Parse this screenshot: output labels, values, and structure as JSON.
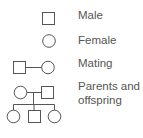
{
  "legend": {
    "items": [
      {
        "symbol": "square",
        "label": "Male"
      },
      {
        "symbol": "circle",
        "label": "Female"
      },
      {
        "symbol": "square-line-circle",
        "label": "Mating"
      },
      {
        "symbol": "pedigree-family",
        "label_line1": "Parents and",
        "label_line2": "offspring"
      }
    ]
  },
  "colors": {
    "stroke": "#555555",
    "text": "#555555",
    "background": "#ffffff"
  }
}
